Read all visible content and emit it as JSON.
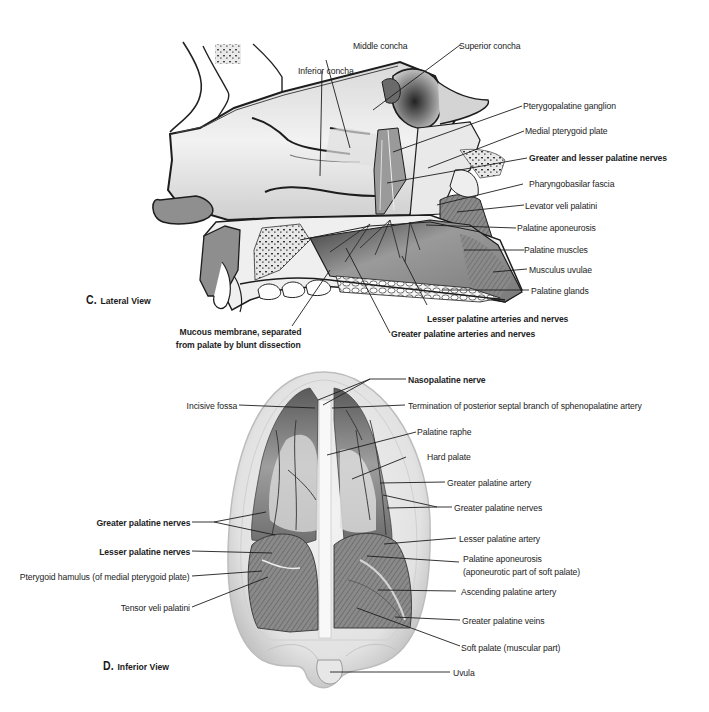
{
  "lateral_view": {
    "title_letter": "C.",
    "title_name": "Lateral View",
    "labels": {
      "middle_concha": "Middle concha",
      "superior_concha": "Superior concha",
      "inferior_concha": "Inferior concha",
      "pterygopalatine_ganglion": "Pterygopalatine ganglion",
      "medial_pterygoid_plate": "Medial pterygoid plate",
      "greater_lesser_palatine_nerves": "Greater and lesser palatine nerves",
      "pharyngobasilar_fascia": "Pharyngobasilar fascia",
      "levator_veli_palatini": "Levator veli palatini",
      "palatine_aponeurosis": "Palatine aponeurosis",
      "palatine_muscles": "Palatine muscles",
      "musculus_uvulae": "Musculus uvulae",
      "palatine_glands": "Palatine glands",
      "lesser_palatine_arteries_nerves": "Lesser palatine arteries and nerves",
      "greater_palatine_arteries_nerves": "Greater palatine arteries and nerves",
      "mucous_membrane_line1": "Mucous membrane, separated",
      "mucous_membrane_line2": "from palate by blunt dissection"
    }
  },
  "inferior_view": {
    "title_letter": "D.",
    "title_name": "Inferior View",
    "labels": {
      "nasopalatine_nerve": "Nasopalatine nerve",
      "incisive_fossa": "Incisive fossa",
      "termination_septal_branch": "Termination of posterior septal branch of sphenopalatine artery",
      "palatine_raphe": "Palatine raphe",
      "hard_palate": "Hard palate",
      "greater_palatine_artery": "Greater palatine artery",
      "greater_palatine_nerves_right": "Greater palatine nerves",
      "greater_palatine_nerves_left": "Greater palatine nerves",
      "lesser_palatine_artery": "Lesser palatine artery",
      "lesser_palatine_nerves": "Lesser palatine nerves",
      "palatine_aponeurosis_line1": "Palatine aponeurosis",
      "palatine_aponeurosis_line2": "(aponeurotic part of soft palate)",
      "pterygoid_hamulus": "Pterygoid hamulus (of medial pterygoid plate)",
      "ascending_palatine_artery": "Ascending palatine artery",
      "tensor_veli_palatini": "Tensor veli palatini",
      "greater_palatine_veins": "Greater palatine veins",
      "soft_palate": "Soft palate (muscular part)",
      "uvula": "Uvula"
    }
  },
  "colors": {
    "ink": "#1d1d1d",
    "background": "#ffffff",
    "tissue_light": "#e6e6e6",
    "tissue_mid": "#a8a8a8",
    "tissue_dark": "#4a4a4a"
  }
}
